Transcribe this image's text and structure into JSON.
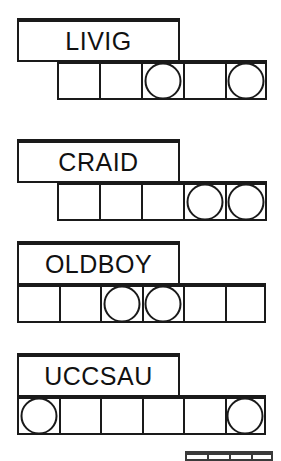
{
  "sheet": {
    "title": "word-scramble-puzzle-sheet",
    "ink_color": "#1a1a1a",
    "paper_color": "#ffffff"
  },
  "rows": [
    {
      "id": "row-1",
      "word": "LIVIG",
      "label_box": {
        "x": 17,
        "y": 18,
        "width": 163,
        "height": 44
      },
      "cell_strip": {
        "x": 57,
        "y": 60,
        "cell_width": 42,
        "cell_height": 40,
        "count": 5
      },
      "circle_cells": [
        3,
        5
      ]
    },
    {
      "id": "row-2",
      "word": "CRAID",
      "label_box": {
        "x": 17,
        "y": 139,
        "width": 163,
        "height": 44
      },
      "cell_strip": {
        "x": 57,
        "y": 181,
        "cell_width": 42,
        "cell_height": 40,
        "count": 5
      },
      "circle_cells": [
        4,
        5
      ]
    },
    {
      "id": "row-3",
      "word": "OLDBOY",
      "label_box": {
        "x": 17,
        "y": 241,
        "width": 163,
        "height": 44
      },
      "cell_strip": {
        "x": 17,
        "y": 283,
        "cell_width": 41.5,
        "cell_height": 40,
        "count": 6
      },
      "circle_cells": [
        3,
        4
      ]
    },
    {
      "id": "row-4",
      "word": "UCCSAU",
      "label_box": {
        "x": 17,
        "y": 353,
        "width": 163,
        "height": 44
      },
      "cell_strip": {
        "x": 17,
        "y": 395,
        "cell_width": 41.5,
        "cell_height": 40,
        "count": 6
      },
      "circle_cells": [
        1,
        6
      ]
    }
  ],
  "partial_row": {
    "id": "row-5-partial",
    "cell_strip": {
      "x": 185,
      "y": 451,
      "cell_width": 22,
      "cell_height": 10,
      "count": 4
    }
  }
}
